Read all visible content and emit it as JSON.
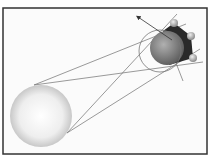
{
  "diagram": {
    "type": "eclipse-shadow-geometry",
    "frame": {
      "x": 3,
      "y": 8,
      "width": 204,
      "height": 146,
      "stroke": "#333333",
      "fill": "#fbfbfb"
    },
    "sun": {
      "cx": 41,
      "cy": 116,
      "r": 31,
      "color_light": "#ffffff",
      "color_dark": "#c8c8c8"
    },
    "planet": {
      "cx": 167,
      "cy": 48,
      "r": 17,
      "color_light": "#b0b0b0",
      "color_dark": "#5a5a5a"
    },
    "umbra_shadow": {
      "color": "#2a2a2a"
    },
    "orbit": {
      "cx": 160,
      "cy": 51,
      "r": 21,
      "stroke": "#777777"
    },
    "moons": [
      {
        "cx": 174,
        "cy": 23,
        "r": 4
      },
      {
        "cx": 191,
        "cy": 36,
        "r": 4
      },
      {
        "cx": 193,
        "cy": 58,
        "r": 4
      }
    ],
    "arrow": {
      "x1": 172,
      "y1": 40,
      "x2": 138,
      "y2": 17
    },
    "lines": [
      {
        "x1": 34,
        "y1": 85,
        "x2": 186,
        "y2": 24
      },
      {
        "x1": 34,
        "y1": 85,
        "x2": 203,
        "y2": 62
      },
      {
        "x1": 67,
        "y1": 133,
        "x2": 177,
        "y2": 14
      },
      {
        "x1": 67,
        "y1": 133,
        "x2": 200,
        "y2": 49
      },
      {
        "x1": 176,
        "y1": 63,
        "x2": 183,
        "y2": 81
      }
    ],
    "line_color": "#6e6e6e"
  }
}
